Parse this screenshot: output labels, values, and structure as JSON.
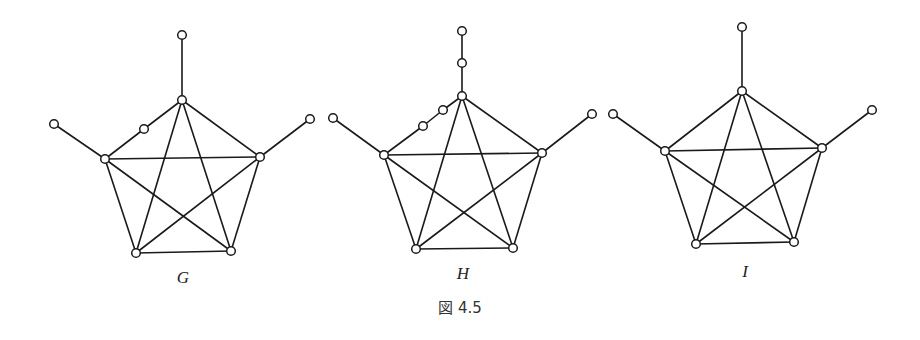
{
  "figure": {
    "caption": "図 4.5",
    "caption_pos": [
      460,
      313
    ],
    "colors": {
      "stroke": "#1a1a1a",
      "node_fill": "#ffffff",
      "background": "#ffffff"
    }
  },
  "graphs": [
    {
      "label": "G",
      "label_pos": [
        183,
        283
      ],
      "nodes": [
        [
          182,
          100
        ],
        [
          105,
          159
        ],
        [
          260,
          157
        ],
        [
          136,
          253
        ],
        [
          231,
          251
        ],
        [
          182,
          35
        ],
        [
          54,
          124
        ],
        [
          310,
          119
        ],
        [
          144,
          129
        ]
      ],
      "edges": [
        [
          0,
          8
        ],
        [
          8,
          1
        ],
        [
          0,
          2
        ],
        [
          1,
          2
        ],
        [
          1,
          3
        ],
        [
          2,
          4
        ],
        [
          3,
          4
        ],
        [
          0,
          3
        ],
        [
          0,
          4
        ],
        [
          1,
          4
        ],
        [
          2,
          3
        ],
        [
          0,
          5
        ],
        [
          1,
          6
        ],
        [
          2,
          7
        ]
      ]
    },
    {
      "label": "H",
      "label_pos": [
        463,
        279
      ],
      "nodes": [
        [
          462,
          96
        ],
        [
          384,
          155
        ],
        [
          542,
          153
        ],
        [
          416,
          249
        ],
        [
          513,
          248
        ],
        [
          462,
          63
        ],
        [
          462,
          31
        ],
        [
          333,
          118
        ],
        [
          592,
          114
        ],
        [
          423,
          126
        ],
        [
          443,
          110
        ]
      ],
      "edges": [
        [
          0,
          10
        ],
        [
          10,
          9
        ],
        [
          9,
          1
        ],
        [
          0,
          2
        ],
        [
          1,
          2
        ],
        [
          1,
          3
        ],
        [
          2,
          4
        ],
        [
          3,
          4
        ],
        [
          0,
          3
        ],
        [
          0,
          4
        ],
        [
          1,
          4
        ],
        [
          2,
          3
        ],
        [
          0,
          5
        ],
        [
          5,
          6
        ],
        [
          1,
          7
        ],
        [
          2,
          8
        ]
      ]
    },
    {
      "label": "I",
      "label_pos": [
        745,
        277
      ],
      "nodes": [
        [
          742,
          91
        ],
        [
          665,
          151
        ],
        [
          822,
          148
        ],
        [
          696,
          244
        ],
        [
          794,
          242
        ],
        [
          742,
          27
        ],
        [
          613,
          114
        ],
        [
          872,
          110
        ]
      ],
      "edges": [
        [
          0,
          1
        ],
        [
          0,
          2
        ],
        [
          1,
          2
        ],
        [
          1,
          3
        ],
        [
          2,
          4
        ],
        [
          3,
          4
        ],
        [
          0,
          3
        ],
        [
          0,
          4
        ],
        [
          1,
          4
        ],
        [
          2,
          3
        ],
        [
          0,
          5
        ],
        [
          1,
          6
        ],
        [
          2,
          7
        ]
      ]
    }
  ]
}
